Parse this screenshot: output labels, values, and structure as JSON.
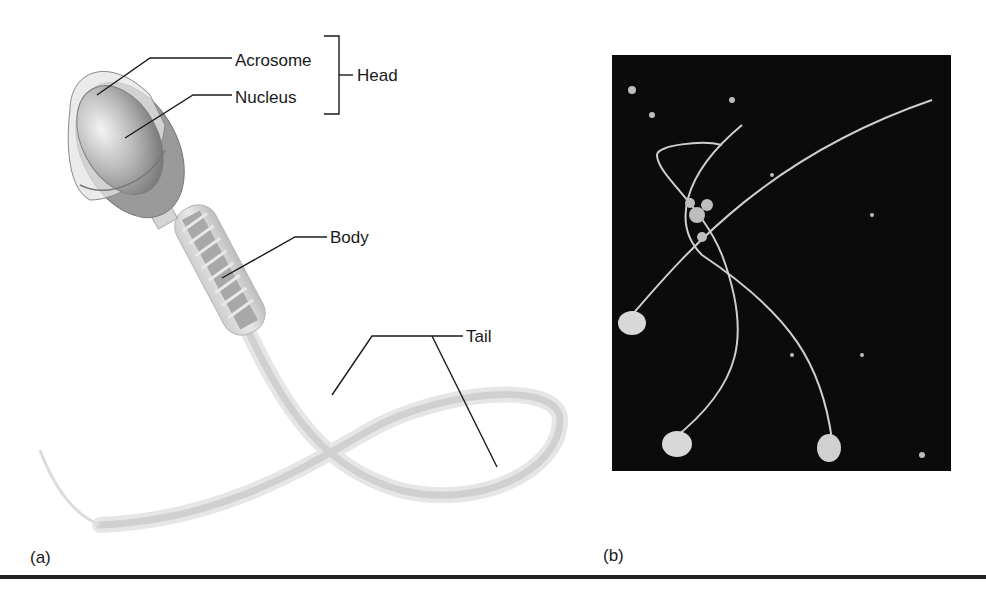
{
  "figure": {
    "panel_a": {
      "label": "(a)",
      "annotations": {
        "acrosome": "Acrosome",
        "nucleus": "Nucleus",
        "head": "Head",
        "body": "Body",
        "tail": "Tail"
      }
    },
    "panel_b": {
      "label": "(b)",
      "description": "Micrograph of three sperm cells on dark background"
    },
    "colors": {
      "background": "#ffffff",
      "line": "#1a1a1a",
      "photo_bg": "#0b0b0b",
      "cell_fill": "#d8d8d8"
    }
  }
}
